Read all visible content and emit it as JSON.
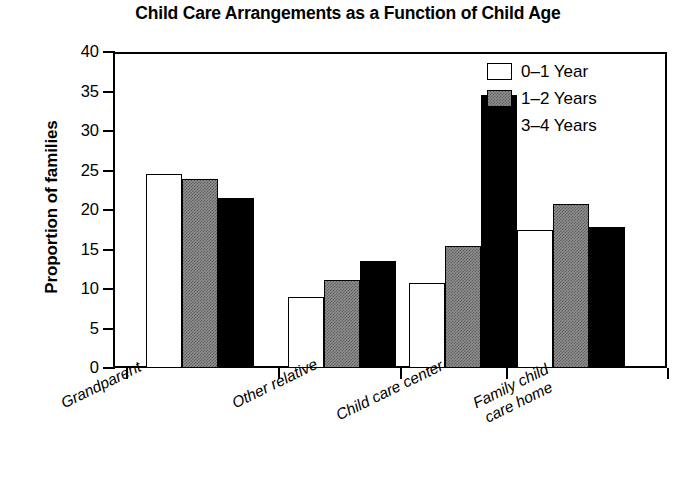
{
  "chart_data": {
    "type": "bar",
    "title": "Child Care Arrangements as a Function of Child Age",
    "xlabel": "",
    "ylabel": "Proportion of families",
    "categories": [
      "Grandparent",
      "Other relative",
      "Child care center",
      "Family child care home"
    ],
    "series": [
      {
        "name": "0–1 Year",
        "values": [
          24.6,
          9.0,
          10.8,
          17.5
        ]
      },
      {
        "name": "1–2 Years",
        "values": [
          23.9,
          11.2,
          15.5,
          20.8
        ]
      },
      {
        "name": "3–4 Years",
        "values": [
          21.5,
          13.5,
          34.6,
          17.8
        ]
      }
    ],
    "ylim": [
      0,
      40
    ],
    "yticks": [
      0,
      5,
      10,
      15,
      20,
      25,
      30,
      35,
      40
    ],
    "ytick_labels": [
      "0",
      "5",
      "10",
      "15",
      "20",
      "25",
      "30",
      "35",
      "40"
    ],
    "grid": false,
    "legend_position": "top-right",
    "colors": {
      "series_0": "#ffffff",
      "series_1": "#8f8f8f",
      "series_2": "#000000",
      "axis": "#000000",
      "background": "#ffffff"
    }
  },
  "category_label_lines": [
    [
      "Grandparent"
    ],
    [
      "Other relative"
    ],
    [
      "Child care center"
    ],
    [
      "Family child",
      "care home"
    ]
  ]
}
